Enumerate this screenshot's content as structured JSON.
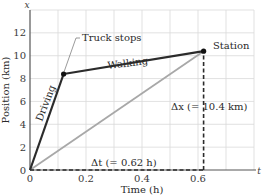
{
  "chart_data": {
    "type": "line",
    "title": "",
    "xlabel": "Time (h)",
    "ylabel": "Position (km)",
    "x_axis_symbol": "t",
    "y_axis_symbol": "x",
    "xlim": [
      0,
      0.8
    ],
    "ylim": [
      0,
      14
    ],
    "x_ticks": [
      0,
      0.2,
      0.4,
      0.6
    ],
    "x_tick_labels": [
      "0",
      "0.2",
      "0.4",
      "0.6"
    ],
    "y_ticks": [
      0,
      2,
      4,
      6,
      8,
      10,
      12
    ],
    "y_tick_labels": [
      "0",
      "2",
      "4",
      "6",
      "8",
      "10",
      "12"
    ],
    "grid": true,
    "grid_x_step": 0.1,
    "grid_y_step": 2,
    "series": [
      {
        "name": "Driving",
        "x": [
          0,
          0.12
        ],
        "y": [
          0,
          8.4
        ],
        "color": "#2b2b2b",
        "style": "solid"
      },
      {
        "name": "Walking",
        "x": [
          0.12,
          0.62
        ],
        "y": [
          8.4,
          10.4
        ],
        "color": "#2b2b2b",
        "style": "solid"
      },
      {
        "name": "Average velocity",
        "x": [
          0,
          0.62
        ],
        "y": [
          0,
          10.4
        ],
        "color": "#a8a8a8",
        "style": "solid"
      },
      {
        "name": "Δt guide",
        "x": [
          0,
          0.62
        ],
        "y": [
          0,
          0
        ],
        "color": "#2b2b2b",
        "style": "dashed"
      },
      {
        "name": "Δx guide",
        "x": [
          0.62,
          0.62
        ],
        "y": [
          0,
          10.4
        ],
        "color": "#2b2b2b",
        "style": "dashed"
      }
    ],
    "points": [
      {
        "label": "Truck stops",
        "x": 0.12,
        "y": 8.4
      },
      {
        "label": "Station",
        "x": 0.62,
        "y": 10.4
      }
    ],
    "annotations": [
      {
        "text": "Truck stops",
        "target": "truck-stop-point"
      },
      {
        "text": "Station",
        "target": "station-point"
      },
      {
        "text": "Driving",
        "along": "driving-segment"
      },
      {
        "text": "Walking",
        "along": "walking-segment"
      },
      {
        "text": "Δx (= 10.4 km)",
        "near": "delta-x-guide"
      },
      {
        "text": "Δt (= 0.62 h)",
        "near": "delta-t-guide"
      }
    ]
  },
  "labels": {
    "x_axis_title": "Time (h)",
    "y_axis_title": "Position (km)",
    "x_symbol": "t",
    "y_symbol": "x",
    "truck_stops": "Truck stops",
    "station": "Station",
    "driving": "Driving",
    "walking": "Walking",
    "delta_x": "Δx (= 10.4 km)",
    "delta_t": "Δt (= 0.62 h)"
  },
  "colors": {
    "main_line": "#2b2b2b",
    "average_line": "#a8a8a8",
    "grid": "#d9d9d9",
    "axis": "#555555"
  }
}
